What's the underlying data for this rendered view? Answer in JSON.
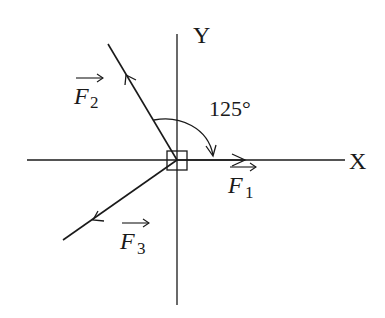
{
  "diagram": {
    "type": "force-vector-diagram",
    "axes": {
      "x_label": "X",
      "y_label": "Y"
    },
    "vectors": [
      {
        "id": "F1",
        "symbol": "F",
        "subscript": "1",
        "direction": "along +X axis"
      },
      {
        "id": "F2",
        "symbol": "F",
        "subscript": "2",
        "direction": "upper-left, second quadrant"
      },
      {
        "id": "F3",
        "symbol": "F",
        "subscript": "3",
        "direction": "lower-left, third quadrant"
      }
    ],
    "angle": {
      "value": "125°",
      "between": [
        "F2",
        "F1"
      ]
    },
    "body": "small square at origin",
    "colors": {
      "stroke": "#1a1a1a",
      "background": "#ffffff"
    }
  }
}
